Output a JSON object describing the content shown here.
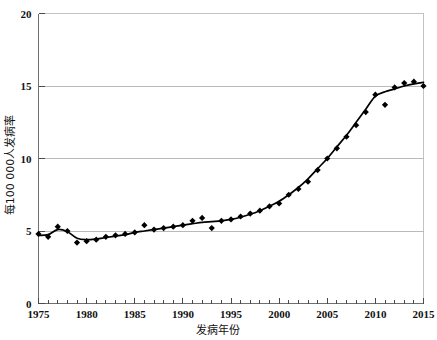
{
  "chart_data": {
    "type": "scatter",
    "title": "",
    "xlabel": "发病年份",
    "ylabel": "每100 000人发病率",
    "xlim": [
      1975,
      2015
    ],
    "ylim": [
      0,
      20
    ],
    "xticks": [
      1975,
      1980,
      1985,
      1990,
      1995,
      2000,
      2005,
      2010,
      2015
    ],
    "xtick_labels": [
      "1975",
      "1980",
      "1985",
      "1990",
      "1995",
      "2000",
      "2005",
      "2010",
      "2015"
    ],
    "yticks": [
      0,
      5,
      10,
      15,
      20
    ],
    "ytick_labels": [
      "0",
      "5",
      "10",
      "15",
      "20"
    ],
    "minor_xtick_interval": 1,
    "grid": "horizontal",
    "legend": "none",
    "marker": "diamond",
    "marker_color": "#000000",
    "line_color": "#000000",
    "grid_color": "#b9b9b9",
    "x": [
      1975,
      1976,
      1977,
      1978,
      1979,
      1980,
      1981,
      1982,
      1983,
      1984,
      1985,
      1986,
      1987,
      1988,
      1989,
      1990,
      1991,
      1992,
      1993,
      1994,
      1995,
      1996,
      1997,
      1998,
      1999,
      2000,
      2001,
      2002,
      2003,
      2004,
      2005,
      2006,
      2007,
      2008,
      2009,
      2010,
      2011,
      2012,
      2013,
      2014,
      2015
    ],
    "values": [
      4.8,
      4.6,
      5.3,
      5.0,
      4.2,
      4.3,
      4.4,
      4.6,
      4.7,
      4.8,
      4.9,
      5.4,
      5.1,
      5.2,
      5.3,
      5.4,
      5.7,
      5.9,
      5.2,
      5.7,
      5.8,
      6.0,
      6.2,
      6.4,
      6.7,
      6.9,
      7.5,
      7.9,
      8.4,
      9.2,
      10.0,
      10.7,
      11.5,
      12.3,
      13.2,
      14.4,
      13.7,
      14.9,
      15.2,
      15.3,
      15.0
    ],
    "series_name": "发病率",
    "trend": [
      [
        1975,
        4.7
      ],
      [
        1976,
        4.75
      ],
      [
        1977,
        5.1
      ],
      [
        1978,
        4.95
      ],
      [
        1979,
        4.5
      ],
      [
        1980,
        4.4
      ],
      [
        1981,
        4.45
      ],
      [
        1982,
        4.55
      ],
      [
        1983,
        4.65
      ],
      [
        1984,
        4.75
      ],
      [
        1985,
        4.9
      ],
      [
        1986,
        5.0
      ],
      [
        1987,
        5.1
      ],
      [
        1988,
        5.2
      ],
      [
        1989,
        5.3
      ],
      [
        1990,
        5.4
      ],
      [
        1991,
        5.5
      ],
      [
        1992,
        5.6
      ],
      [
        1993,
        5.65
      ],
      [
        1994,
        5.7
      ],
      [
        1995,
        5.8
      ],
      [
        1996,
        5.95
      ],
      [
        1997,
        6.15
      ],
      [
        1998,
        6.4
      ],
      [
        1999,
        6.7
      ],
      [
        2000,
        7.05
      ],
      [
        2001,
        7.5
      ],
      [
        2002,
        8.0
      ],
      [
        2003,
        8.6
      ],
      [
        2004,
        9.3
      ],
      [
        2005,
        10.0
      ],
      [
        2006,
        10.8
      ],
      [
        2007,
        11.6
      ],
      [
        2008,
        12.5
      ],
      [
        2009,
        13.4
      ],
      [
        2010,
        14.3
      ],
      [
        2011,
        14.6
      ],
      [
        2012,
        14.8
      ],
      [
        2013,
        15.0
      ],
      [
        2014,
        15.15
      ],
      [
        2015,
        15.25
      ]
    ]
  }
}
